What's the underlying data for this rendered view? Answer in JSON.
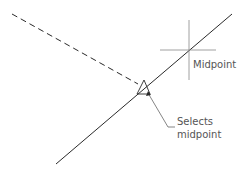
{
  "diagram": {
    "labels": {
      "midpoint": "Midpoint",
      "selects_line1": "Selects",
      "selects_line2": "midpoint"
    },
    "colors": {
      "line": "#2a2a2a",
      "crosshair": "#888888",
      "text": "#555555",
      "background": "#ffffff"
    },
    "elements": {
      "dashed_line": {
        "x1": 12,
        "y1": 14,
        "x2": 138,
        "y2": 84
      },
      "solid_line": {
        "x1": 56,
        "y1": 164,
        "x2": 232,
        "y2": 14
      },
      "crosshair_center": {
        "x": 189,
        "y": 50
      },
      "aperture_marker": "triangle"
    }
  }
}
